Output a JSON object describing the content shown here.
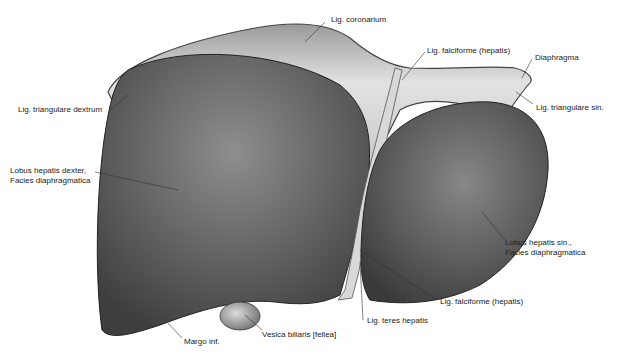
{
  "diagram": {
    "labels": [
      {
        "id": "lig-coronarium",
        "text": "Lig. coronarium"
      },
      {
        "id": "lig-falciforme-top",
        "text": "Lig. falciforme (hepatis)"
      },
      {
        "id": "diaphragma",
        "text": "Diaphragma"
      },
      {
        "id": "lig-triangulare-sin",
        "text": "Lig. triangulare sin."
      },
      {
        "id": "lig-triangulare-dextrum",
        "text": "Lig. triangulare dextrum"
      },
      {
        "id": "lobus-dexter-1",
        "text": "Lobus hepatis dexter,"
      },
      {
        "id": "lobus-dexter-2",
        "text": "Facies diaphragmatica"
      },
      {
        "id": "lobus-sin-1",
        "text": "Lobus hepatis sin.,"
      },
      {
        "id": "lobus-sin-2",
        "text": "Facies diaphragmatica"
      },
      {
        "id": "lig-falciforme-bottom",
        "text": "Lig. falciforme (hepatis)"
      },
      {
        "id": "lig-teres",
        "text": "Lig. teres hepatis"
      },
      {
        "id": "vesica",
        "text": "Vesica biliaris [fellea]"
      },
      {
        "id": "margo",
        "text": "Margo inf."
      }
    ],
    "colors": {
      "liver": "#5a5a5a",
      "liver_highlight": "#8a8a8a",
      "membrane": "#d9d9d9",
      "line": "#333333"
    }
  }
}
